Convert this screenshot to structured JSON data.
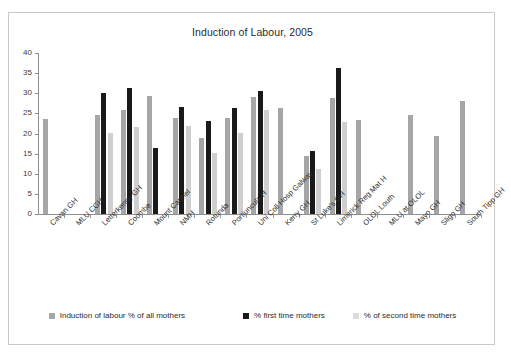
{
  "chart_data": {
    "type": "bar",
    "title": "Induction of Labour, 2005",
    "xlabel": "",
    "ylabel": "",
    "ylim": [
      0,
      40
    ],
    "yticks": [
      0,
      5,
      10,
      15,
      20,
      25,
      30,
      35,
      40
    ],
    "grid": false,
    "legend_position": "bottom",
    "categories": [
      "Cavan GH",
      "MLU CGH",
      "Letterkenny GH",
      "Coombe",
      "Mount Carmel",
      "NMH",
      "Rotunda",
      "Portiuncula H",
      "Uni Coll Hosp Galway",
      "Kerry GH",
      "St Luke's GH",
      "Limerick Reg Mat H",
      "OLOL Louth",
      "MLU at OLOL",
      "Mayo GH",
      "Sligo GH",
      "South Tipp GH"
    ],
    "series": [
      {
        "name": "Induction of labour % of all mothers",
        "color": "#a6a6a6",
        "values": [
          23.7,
          null,
          24.5,
          25.8,
          29.4,
          23.8,
          19.0,
          23.8,
          29.0,
          26.3,
          14.5,
          28.8,
          23.4,
          null,
          24.7,
          19.4,
          28.0
        ]
      },
      {
        "name": "% first time mothers",
        "color": "#1a1a1a",
        "values": [
          null,
          null,
          30.0,
          31.4,
          16.4,
          26.7,
          23.0,
          26.3,
          30.6,
          null,
          15.6,
          36.2,
          null,
          null,
          null,
          null,
          null
        ]
      },
      {
        "name": "% of second time mothers",
        "color": "#cfcfcf",
        "values": [
          null,
          null,
          20.2,
          21.6,
          null,
          21.9,
          15.1,
          20.1,
          25.8,
          null,
          11.3,
          22.9,
          null,
          null,
          null,
          null,
          null
        ]
      }
    ]
  },
  "colors": {
    "series_all_mothers": "#a6a6a6",
    "series_first_time": "#1a1a1a",
    "series_second_time": "#cfcfcf",
    "axis": "#8f8f8f",
    "frame": "#c9c9c9",
    "background": "#ffffff",
    "text": "#2b2b2b"
  }
}
